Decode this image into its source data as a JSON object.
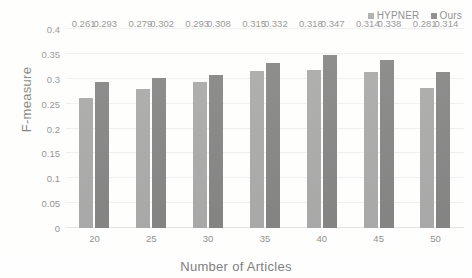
{
  "chart_data": {
    "type": "bar",
    "title": "",
    "xlabel": "Number of Articles",
    "ylabel": "F-measure",
    "categories": [
      "20",
      "25",
      "30",
      "35",
      "40",
      "45",
      "50"
    ],
    "series": [
      {
        "name": "HYPNER",
        "color": "#9a9a9a",
        "values": [
          0.261,
          0.279,
          0.293,
          0.315,
          0.318,
          0.314,
          0.281
        ],
        "labels": [
          "0.261",
          "0.279",
          "0.293",
          "0.315",
          "0.318",
          "0.314",
          "0.281"
        ]
      },
      {
        "name": "Ours",
        "color": "#6f6f6f",
        "values": [
          0.293,
          0.302,
          0.308,
          0.332,
          0.347,
          0.338,
          0.314
        ],
        "labels": [
          "0.293",
          "0.302",
          "0.308",
          "0.332",
          "0.347",
          "0.338",
          "0.314"
        ]
      }
    ],
    "ylim": [
      0,
      0.4
    ],
    "yticks": [
      "0",
      "0.05",
      "0.1",
      "0.15",
      "0.2",
      "0.25",
      "0.3",
      "0.35",
      "0.4"
    ],
    "ytick_values": [
      0,
      0.05,
      0.1,
      0.15,
      0.2,
      0.25,
      0.3,
      0.35,
      0.4
    ],
    "grid": true,
    "legend_position": "top-right"
  }
}
